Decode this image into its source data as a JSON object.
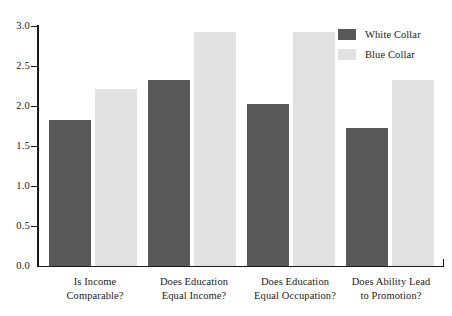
{
  "chart_data": {
    "type": "bar",
    "title": "",
    "xlabel": "",
    "ylabel": "",
    "ylim": [
      0.0,
      3.0
    ],
    "grid": false,
    "legend_position": "top-right",
    "categories": [
      "Is Income Comparable?",
      "Does Education Equal Income?",
      "Does Education Equal Occupation?",
      "Does Ability Lead to Promotion?"
    ],
    "category_lines": [
      [
        "Is Income",
        "Comparable?"
      ],
      [
        "Does Education",
        "Equal Income?"
      ],
      [
        "Does Education",
        "Equal Occupation?"
      ],
      [
        "Does Ability Lead",
        "to Promotion?"
      ]
    ],
    "series": [
      {
        "name": "White Collar",
        "color": "#595959",
        "values": [
          1.82,
          2.32,
          2.02,
          1.73
        ]
      },
      {
        "name": "Blue Collar",
        "color": "#e1e1e1",
        "values": [
          2.21,
          2.93,
          2.93,
          2.32
        ]
      }
    ],
    "ytick_labels": [
      "0.0",
      "0.5",
      "1.0",
      "1.5",
      "2.0",
      "2.5",
      "3.0"
    ],
    "ytick_values": [
      0.0,
      0.5,
      1.0,
      1.5,
      2.0,
      2.5,
      3.0
    ]
  },
  "legend": {
    "items": [
      {
        "label": "White Collar"
      },
      {
        "label": "Blue Collar"
      }
    ]
  }
}
